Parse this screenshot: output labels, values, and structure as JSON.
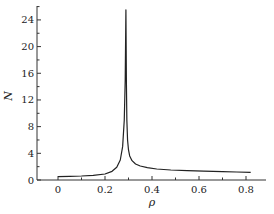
{
  "chart_data": {
    "type": "line",
    "title": "",
    "xlabel": "ρ",
    "ylabel": "N",
    "xlim": [
      -0.09,
      0.88
    ],
    "ylim": [
      0,
      27
    ],
    "x_ticks": [
      0,
      0.2,
      0.4,
      0.6,
      0.8
    ],
    "x_tick_labels": [
      "0",
      "0.2",
      "0.4",
      "0.6",
      "0.8"
    ],
    "y_ticks": [
      0,
      4,
      8,
      12,
      16,
      20,
      24
    ],
    "y_tick_labels": [
      "0",
      "4",
      "8",
      "12",
      "16",
      "20",
      "24"
    ],
    "grid": false,
    "legend": null,
    "series": [
      {
        "name": "N(ρ)",
        "color": "#222222",
        "x": [
          0.0,
          0.05,
          0.1,
          0.15,
          0.2,
          0.23,
          0.25,
          0.265,
          0.275,
          0.282,
          0.286,
          0.289,
          0.291,
          0.293,
          0.296,
          0.3,
          0.305,
          0.315,
          0.33,
          0.35,
          0.38,
          0.42,
          0.48,
          0.55,
          0.62,
          0.7,
          0.76,
          0.82
        ],
        "y": [
          0.5,
          0.55,
          0.6,
          0.7,
          0.9,
          1.3,
          1.9,
          3.0,
          5.0,
          9.0,
          15.0,
          25.5,
          15.0,
          9.0,
          6.0,
          4.5,
          3.6,
          2.9,
          2.4,
          2.1,
          1.85,
          1.65,
          1.5,
          1.4,
          1.32,
          1.25,
          1.2,
          1.15
        ]
      }
    ]
  }
}
